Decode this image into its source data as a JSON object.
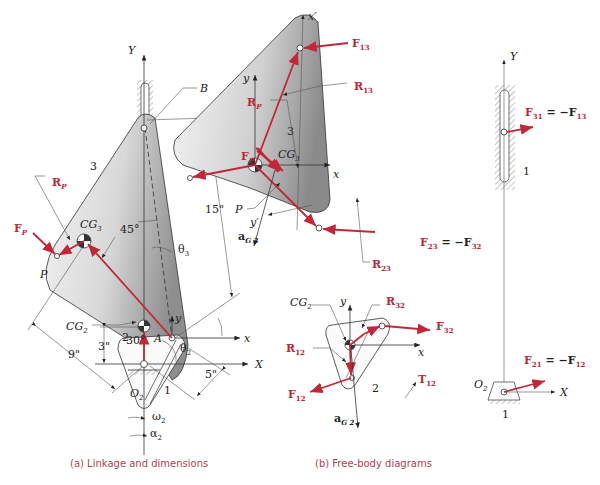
{
  "figure": {
    "captions": {
      "a": "(a)  Linkage and dimensions",
      "b": "(b)  Free-body diagrams"
    },
    "colors": {
      "force": "#c0283a",
      "caption": "#b0424f",
      "link_fill_light": "#f2f2f2",
      "link_fill_dark": "#9a9a9a"
    }
  },
  "linkage": {
    "axis_Y": "Y",
    "axis_X": "X",
    "point_B": "B",
    "point_A": "A",
    "point_P": "P",
    "point_O2": "O",
    "point_O2_sub": "2",
    "link3": "3",
    "link2": "2",
    "ground": "1",
    "cg3": "CG",
    "cg3_sub": "3",
    "cg2": "CG",
    "cg2_sub": "2",
    "angle_45": "45°",
    "angle_30": "30°",
    "theta3": "θ",
    "theta3_sub": "3",
    "theta2": "θ",
    "theta2_sub": "2",
    "dim_15": "15\"",
    "dim_9": "9\"",
    "dim_5": "5\"",
    "dim_3": "3\"",
    "local_x": "x",
    "local_y": "y",
    "RP": "R",
    "RP_sub": "P",
    "FP": "F",
    "FP_sub": "P",
    "omega2": "ω",
    "omega2_sub": "2",
    "alpha2": "α",
    "alpha2_sub": "2"
  },
  "fbd3": {
    "x_prime": "x′",
    "y_prime": "y′",
    "x": "x",
    "y": "y",
    "link": "3",
    "cg": "CG",
    "cg_sub": "3",
    "P": "P",
    "F13": "F",
    "F13_sub": "13",
    "R13": "R",
    "R13_sub": "13",
    "RP": "R",
    "RP_sub": "P",
    "FP": "F",
    "FP_sub": "P",
    "R23": "R",
    "R23_sub": "23",
    "F23_eq": "F",
    "F23_sub": "23",
    "F23_rhs": "= −F",
    "F23_rhs_sub": "32",
    "aG": "a",
    "aG_sub": "G 3"
  },
  "fbd2": {
    "x": "x",
    "y": "y",
    "link": "2",
    "cg": "CG",
    "cg_sub": "2",
    "R32": "R",
    "R32_sub": "32",
    "F32": "F",
    "F32_sub": "32",
    "R12": "R",
    "R12_sub": "12",
    "F12": "F",
    "F12_sub": "12",
    "T12": "T",
    "T12_sub": "12",
    "aG": "a",
    "aG_sub": "G 2"
  },
  "fbd1": {
    "Y": "Y",
    "X": "X",
    "ground": "1",
    "O2": "O",
    "O2_sub": "2",
    "F31": "F",
    "F31_sub": "31",
    "F31_rhs": "= −F",
    "F31_rhs_sub": "13",
    "F21": "F",
    "F21_sub": "21",
    "F21_rhs": "= −F",
    "F21_rhs_sub": "12"
  }
}
